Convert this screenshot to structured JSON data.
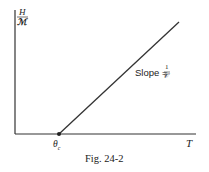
{
  "figure": {
    "caption": "Fig. 24-2",
    "y_axis_label_numerator": "H",
    "y_axis_label_denominator": "ℳ",
    "x_axis_label": "T",
    "x_intercept_label": "θ",
    "x_intercept_subscript": "c",
    "slope_label": "Slope =",
    "slope_numerator": "1",
    "slope_denominator": "𝒞"
  },
  "colors": {
    "line": "#222222",
    "text": "#222222",
    "background": "#ffffff"
  }
}
